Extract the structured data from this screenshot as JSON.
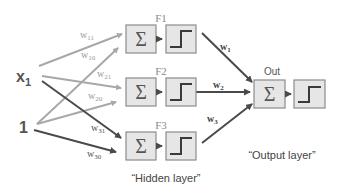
{
  "inputs": [
    {
      "id": "x1",
      "label": "x",
      "subscript": "1"
    },
    {
      "id": "bias",
      "label": "1"
    }
  ],
  "hidden_layer": {
    "caption": "“Hidden layer”",
    "neurons": [
      {
        "label": "F1",
        "sum_symbol": "Σ"
      },
      {
        "label": "F2",
        "sum_symbol": "Σ"
      },
      {
        "label": "F3",
        "sum_symbol": "Σ"
      }
    ]
  },
  "output_layer": {
    "caption": "“Output layer”",
    "neuron": {
      "label": "Out",
      "sum_symbol": "Σ"
    }
  },
  "weights_input_hidden": [
    {
      "label": "w",
      "sub": "11",
      "from": "x1",
      "to": "F1"
    },
    {
      "label": "w",
      "sub": "10",
      "from": "bias",
      "to": "F1"
    },
    {
      "label": "w",
      "sub": "21",
      "from": "x1",
      "to": "F2"
    },
    {
      "label": "w",
      "sub": "20",
      "from": "bias",
      "to": "F2"
    },
    {
      "label": "w",
      "sub": "31",
      "from": "x1",
      "to": "F3"
    },
    {
      "label": "w",
      "sub": "30",
      "from": "bias",
      "to": "F3"
    }
  ],
  "weights_hidden_output": [
    {
      "label": "w",
      "sub": "1",
      "from": "F1",
      "to": "Out"
    },
    {
      "label": "w",
      "sub": "2",
      "from": "F2",
      "to": "Out"
    },
    {
      "label": "w",
      "sub": "3",
      "from": "F3",
      "to": "Out"
    }
  ],
  "colors": {
    "light_arrow": "#a8a8a8",
    "dark_arrow": "#4a4a4a",
    "box_fill": "#e6e6e6",
    "box_stroke": "#8c8c8c",
    "step_stroke": "#3a3a3a",
    "text": "#444444",
    "weight_text_light": "#9a9a9a"
  }
}
